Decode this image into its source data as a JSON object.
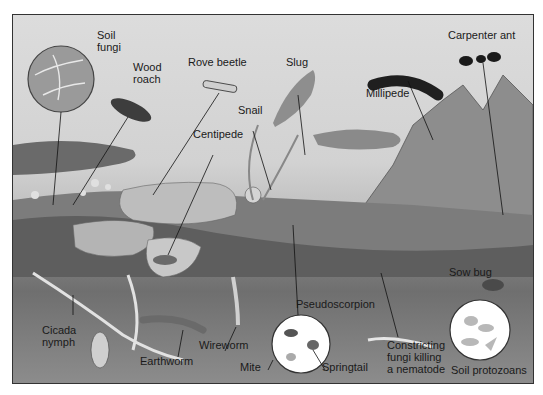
{
  "diagram": {
    "type": "illustration",
    "colors": {
      "sky": "#d8d8d8",
      "soil": "#707070",
      "rock": "#8a8a8a",
      "frame": "#333333",
      "label": "#1a1a1a"
    },
    "labels": [
      {
        "id": "soil-fungi",
        "text": "Soil\nfungi",
        "x": 96,
        "y": 28
      },
      {
        "id": "wood-roach",
        "text": "Wood\nroach",
        "x": 132,
        "y": 60
      },
      {
        "id": "rove-beetle",
        "text": "Rove beetle",
        "x": 187,
        "y": 55
      },
      {
        "id": "snail",
        "text": "Snail",
        "x": 237,
        "y": 103
      },
      {
        "id": "centipede",
        "text": "Centipede",
        "x": 192,
        "y": 127
      },
      {
        "id": "slug",
        "text": "Slug",
        "x": 285,
        "y": 55
      },
      {
        "id": "millipede",
        "text": "Millipede",
        "x": 365,
        "y": 86
      },
      {
        "id": "carpenter-ant",
        "text": "Carpenter ant",
        "x": 447,
        "y": 28
      },
      {
        "id": "sow-bug",
        "text": "Sow bug",
        "x": 448,
        "y": 265
      },
      {
        "id": "pseudoscorpion",
        "text": "Pseudoscorpion",
        "x": 295,
        "y": 297
      },
      {
        "id": "cicada-nymph",
        "text": "Cicada\nnymph",
        "x": 41,
        "y": 323
      },
      {
        "id": "earthworm",
        "text": "Earthworm",
        "x": 139,
        "y": 354
      },
      {
        "id": "wireworm",
        "text": "Wireworm",
        "x": 198,
        "y": 338
      },
      {
        "id": "mite",
        "text": "Mite",
        "x": 239,
        "y": 360
      },
      {
        "id": "springtail",
        "text": "Springtail",
        "x": 321,
        "y": 360
      },
      {
        "id": "constricting-fungi",
        "text": "Constricting\nfungi killing\na nematode",
        "x": 386,
        "y": 338
      },
      {
        "id": "soil-protozoans",
        "text": "Soil protozoans",
        "x": 450,
        "y": 363
      }
    ]
  }
}
